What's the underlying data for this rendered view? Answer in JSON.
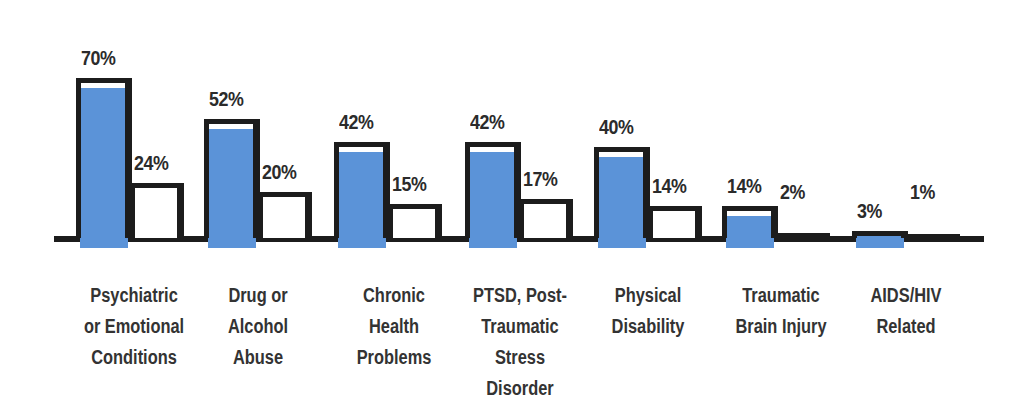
{
  "chart_data": {
    "type": "bar",
    "title": "",
    "xlabel": "",
    "ylabel": "",
    "ylim": [
      0,
      100
    ],
    "grid": false,
    "legend": "none",
    "categories": [
      "Psychiatric or Emotional Conditions",
      "Drug or Alcohol Abuse",
      "Chronic Health Problems",
      "PTSD, Post-Traumatic Stress Disorder",
      "Physical Disability",
      "Traumatic Brain Injury",
      "AIDS/HIV Related"
    ],
    "series": [
      {
        "name": "Series 1 (blue-filled, tall bar)",
        "values": [
          70,
          52,
          42,
          42,
          40,
          14,
          3
        ]
      },
      {
        "name": "Series 2 (white outlined bar)",
        "values": [
          24,
          20,
          15,
          17,
          14,
          2,
          1
        ]
      }
    ],
    "colors": {
      "fill_blue": "#5b93d8",
      "outline": "#1c1c1c",
      "text": "#2b2b2b"
    }
  },
  "labels": {
    "values": [
      [
        "70%",
        "24%"
      ],
      [
        "52%",
        "20%"
      ],
      [
        "42%",
        "15%"
      ],
      [
        "42%",
        "17%"
      ],
      [
        "40%",
        "14%"
      ],
      [
        "14%",
        "2%"
      ],
      [
        "3%",
        "1%"
      ]
    ],
    "categories": [
      [
        "Psychiatric",
        "or Emotional",
        "Conditions"
      ],
      [
        "Drug or",
        "Alcohol",
        "Abuse"
      ],
      [
        "Chronic",
        "Health",
        "Problems"
      ],
      [
        "PTSD, Post-",
        "Traumatic",
        "Stress",
        "Disorder"
      ],
      [
        "Physical",
        "Disability"
      ],
      [
        "Traumatic",
        "Brain Injury"
      ],
      [
        "AIDS/HIV",
        "Related"
      ]
    ]
  }
}
